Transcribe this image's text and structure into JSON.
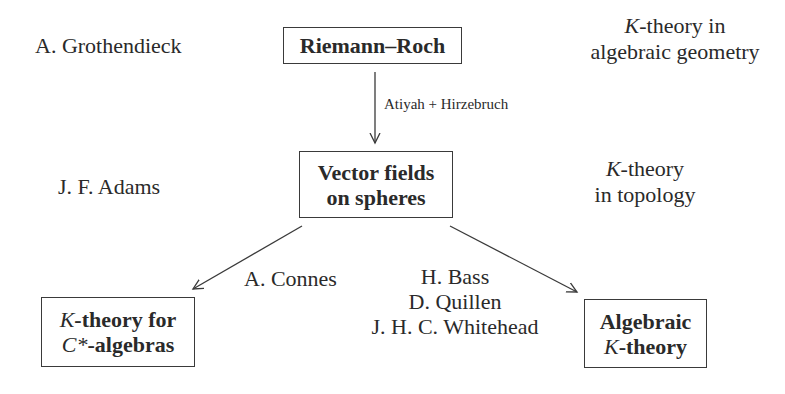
{
  "nodes": {
    "riemann_roch": {
      "label": "Riemann–Roch"
    },
    "vector_fields": {
      "line1": "Vector fields",
      "line2": "on spheres"
    },
    "k_theory_cstar": {
      "line1_italic": "K",
      "line1_rest": "-theory for",
      "line2_italic": "C*",
      "line2_rest": "-algebras"
    },
    "algebraic_k": {
      "line1": "Algebraic",
      "line2_italic": "K",
      "line2_rest": "-theory"
    }
  },
  "people": {
    "grothendieck": "A. Grothendieck",
    "adams": "J. F. Adams",
    "connes": "A. Connes",
    "bass": "H. Bass",
    "quillen": "D. Quillen",
    "whitehead": "J. H. C. Whitehead"
  },
  "edges": {
    "atiyah_hirzebruch": "Atiyah + Hirzebruch"
  },
  "fields": {
    "alg_geom_italic": "K",
    "alg_geom_line1_rest": "-theory in",
    "alg_geom_line2": "algebraic geometry",
    "topology_italic": "K",
    "topology_line1_rest": "-theory",
    "topology_line2": "in topology"
  }
}
